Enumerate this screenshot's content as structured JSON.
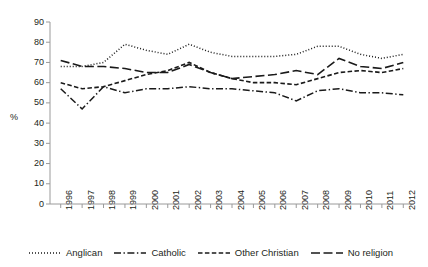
{
  "chart_data": {
    "type": "line",
    "title": "",
    "subtitle": "",
    "xlabel": "",
    "ylabel": "%",
    "ylim": [
      0,
      90
    ],
    "ytick_step": 10,
    "yticks": [
      90,
      80,
      70,
      60,
      50,
      40,
      30,
      20,
      10,
      0
    ],
    "grid": false,
    "legend_position": "bottom",
    "categories": [
      "1996",
      "1997",
      "1998",
      "1999",
      "2000",
      "2001",
      "2002",
      "2003",
      "2004",
      "2005",
      "2006",
      "2007",
      "2008",
      "2009",
      "2010",
      "2011",
      "2012"
    ],
    "series": [
      {
        "name": "Anglican",
        "dash": "dotted",
        "color": "#1a1a1a",
        "values": [
          68,
          68,
          70,
          79,
          76,
          74,
          79,
          75,
          73,
          73,
          73,
          74,
          78,
          78,
          74,
          72,
          74
        ]
      },
      {
        "name": "Catholic",
        "dash": "dash-dot",
        "color": "#1a1a1a",
        "values": [
          57,
          47,
          58,
          55,
          57,
          57,
          58,
          57,
          57,
          56,
          55,
          51,
          56,
          57,
          55,
          55,
          54
        ]
      },
      {
        "name": "Other Christian",
        "dash": "short-dash",
        "color": "#1a1a1a",
        "values": [
          60,
          57,
          58,
          61,
          64,
          66,
          70,
          65,
          62,
          60,
          60,
          59,
          62,
          65,
          66,
          65,
          67
        ]
      },
      {
        "name": "No religion",
        "dash": "long-dash",
        "color": "#1a1a1a",
        "values": [
          71,
          68,
          68,
          67,
          65,
          65,
          69,
          65,
          62,
          63,
          64,
          66,
          64,
          72,
          68,
          67,
          70
        ]
      }
    ]
  },
  "axis": {
    "y_title": "%",
    "yticks": [
      "90",
      "80",
      "70",
      "60",
      "50",
      "40",
      "30",
      "20",
      "10",
      "0"
    ],
    "xticks": [
      "1996",
      "1997",
      "1998",
      "1999",
      "2000",
      "2001",
      "2002",
      "2003",
      "2004",
      "2005",
      "2006",
      "2007",
      "2008",
      "2009",
      "2010",
      "2011",
      "2012"
    ]
  },
  "legend": {
    "items": [
      {
        "label": "Anglican",
        "style": "dotted"
      },
      {
        "label": "Catholic",
        "style": "dash-dot"
      },
      {
        "label": "Other Christian",
        "style": "short-dash"
      },
      {
        "label": "No religion",
        "style": "long-dash"
      }
    ]
  }
}
